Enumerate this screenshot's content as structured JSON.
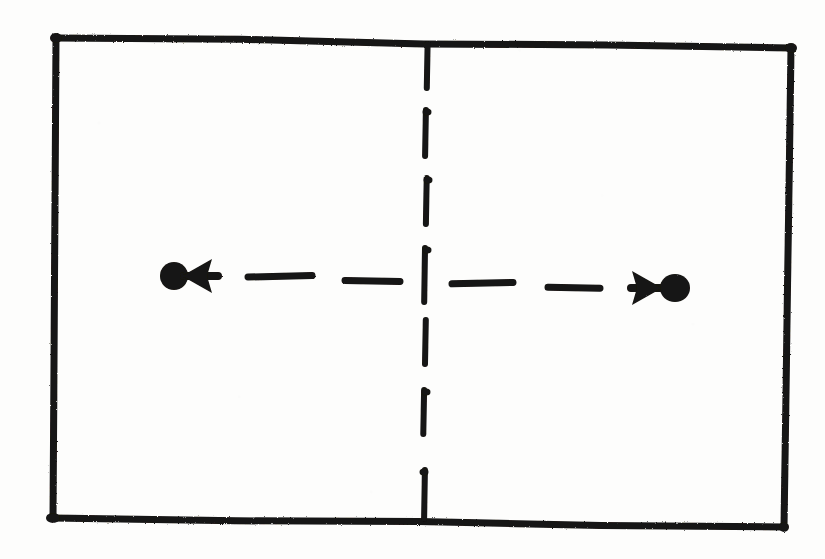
{
  "figure": {
    "kind": "hand-drawn-diagram",
    "background_color": "#fdfdfc",
    "ink_color": "#141312"
  },
  "box": {
    "name": "outer-rectangle",
    "stroke_width": 7,
    "corners": {
      "top_left": [
        56,
        38
      ],
      "top_right": [
        791,
        48
      ],
      "bottom_right": [
        784,
        527
      ],
      "bottom_left": [
        53,
        518
      ]
    }
  },
  "center_line": {
    "name": "vertical-dashed-centre-line",
    "orientation": "vertical",
    "x": 427,
    "stroke_width": 6,
    "dashes": [
      [
        44,
        88
      ],
      [
        110,
        156
      ],
      [
        178,
        224
      ],
      [
        248,
        302
      ],
      [
        320,
        364
      ],
      [
        390,
        434
      ],
      [
        470,
        519
      ]
    ]
  },
  "motion_line": {
    "name": "horizontal-dashed-motion-line",
    "orientation": "horizontal",
    "y": 277,
    "stroke_width": 7,
    "dashes": [
      [
        248,
        312
      ],
      [
        345,
        400
      ],
      [
        452,
        513
      ],
      [
        548,
        600
      ]
    ]
  },
  "particles": [
    {
      "name": "left-particle",
      "label": "",
      "dot": {
        "cx": 174,
        "cy": 276,
        "rx": 14,
        "ry": 14
      },
      "arrow": {
        "name": "left-arrow",
        "direction": "left",
        "tail": [
          218,
          276
        ],
        "tip": [
          182,
          276
        ],
        "head_size": 17,
        "shaft_width": 7
      }
    },
    {
      "name": "right-particle",
      "label": "",
      "dot": {
        "cx": 675,
        "cy": 288,
        "rx": 15,
        "ry": 14
      },
      "arrow": {
        "name": "right-arrow",
        "direction": "right",
        "tail": [
          631,
          288
        ],
        "tip": [
          662,
          288
        ],
        "head_size": 17,
        "shaft_width": 7
      }
    }
  ],
  "caption": {
    "alt_text": "Rectangle with dashed vertical centre line; two dots move outward in opposite directions along a dashed horizontal line."
  }
}
